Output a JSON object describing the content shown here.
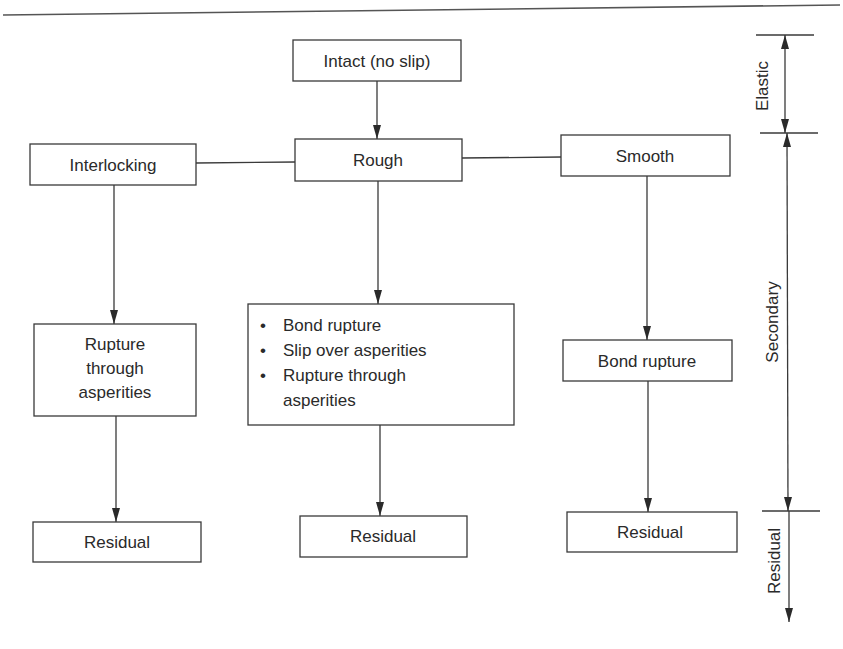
{
  "diagram": {
    "type": "flowchart",
    "nodes": {
      "intact": {
        "label": "Intact (no slip)"
      },
      "interlocking": {
        "label": "Interlocking"
      },
      "rough": {
        "label": "Rough"
      },
      "smooth": {
        "label": "Smooth"
      },
      "interlocking_failure": {
        "lines": [
          "Rupture",
          "through",
          "asperities"
        ]
      },
      "rough_failure": {
        "bullets": [
          "Bond rupture",
          "Slip over asperities",
          "Rupture through",
          "asperities"
        ],
        "bullet_char": "•"
      },
      "smooth_failure": {
        "label": "Bond rupture"
      },
      "residual_left": {
        "label": "Residual"
      },
      "residual_middle": {
        "label": "Residual"
      },
      "residual_right": {
        "label": "Residual"
      }
    },
    "edges": [
      {
        "from": "intact",
        "to": "rough",
        "arrow": true
      },
      {
        "from": "interlocking",
        "to": "rough",
        "arrow": false
      },
      {
        "from": "rough",
        "to": "smooth",
        "arrow": false
      },
      {
        "from": "interlocking",
        "to": "interlocking_failure",
        "arrow": true
      },
      {
        "from": "rough",
        "to": "rough_failure",
        "arrow": true
      },
      {
        "from": "smooth",
        "to": "smooth_failure",
        "arrow": true
      },
      {
        "from": "interlocking_failure",
        "to": "residual_left",
        "arrow": true
      },
      {
        "from": "rough_failure",
        "to": "residual_middle",
        "arrow": true
      },
      {
        "from": "smooth_failure",
        "to": "residual_right",
        "arrow": true
      }
    ],
    "stages": [
      {
        "name": "Elastic",
        "label": "Elastic"
      },
      {
        "name": "Secondary",
        "label": "Secondary"
      },
      {
        "name": "Residual",
        "label": "Residual"
      }
    ]
  }
}
